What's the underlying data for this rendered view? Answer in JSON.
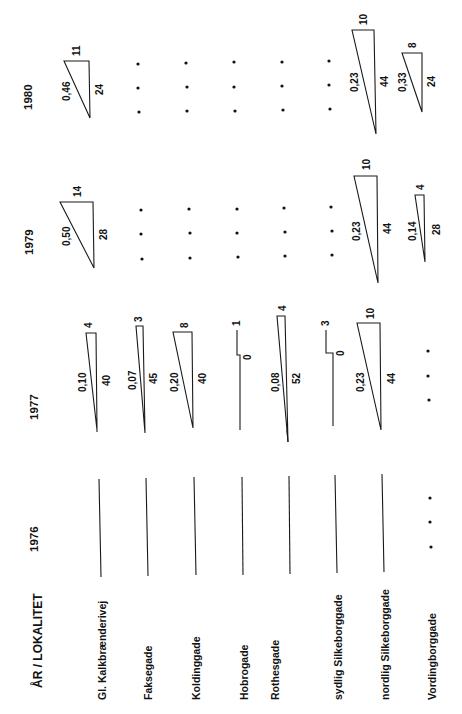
{
  "header": {
    "title": "ÅR / LOKALITET"
  },
  "years": [
    "1976",
    "1977",
    "1979",
    "1980"
  ],
  "localities": [
    "Gl. Kalkbrænderivej",
    "Faksegade",
    "Koldinggade",
    "Hobrogade",
    "Rothesgade",
    "sydlig Silkeborggade",
    "nordlig Silkeborggade",
    "Vordingborggade"
  ],
  "cells": {
    "1976": [
      {
        "type": "line"
      },
      {
        "type": "line"
      },
      {
        "type": "line"
      },
      {
        "type": "line"
      },
      {
        "type": "line"
      },
      {
        "type": "line"
      },
      {
        "type": "line"
      },
      {
        "type": "dots"
      }
    ],
    "1977": [
      {
        "type": "triangle",
        "ratio": "0,10",
        "long": "40",
        "short": "4"
      },
      {
        "type": "triangle",
        "ratio": "0,07",
        "long": "45",
        "short": "3"
      },
      {
        "type": "triangle",
        "ratio": "0,20",
        "long": "40",
        "short": "8"
      },
      {
        "type": "step",
        "long": "0",
        "short": "1"
      },
      {
        "type": "triangle",
        "ratio": "0,08",
        "long": "52",
        "short": "4"
      },
      {
        "type": "step",
        "long": "0",
        "short": "3"
      },
      {
        "type": "triangle",
        "ratio": "0,23",
        "long": "44",
        "short": "10"
      },
      {
        "type": "dots"
      }
    ],
    "1979": [
      {
        "type": "triangle",
        "ratio": "0,50",
        "long": "28",
        "short": "14"
      },
      {
        "type": "dots"
      },
      {
        "type": "dots"
      },
      {
        "type": "dots"
      },
      {
        "type": "dots"
      },
      {
        "type": "dots"
      },
      {
        "type": "triangle",
        "ratio": "0,23",
        "long": "44",
        "short": "10"
      },
      {
        "type": "triangle",
        "ratio": "0,14",
        "long": "28",
        "short": "4"
      }
    ],
    "1980": [
      {
        "type": "triangle",
        "ratio": "0,46",
        "long": "24",
        "short": "11"
      },
      {
        "type": "dots"
      },
      {
        "type": "dots"
      },
      {
        "type": "dots"
      },
      {
        "type": "dots"
      },
      {
        "type": "dots"
      },
      {
        "type": "triangle",
        "ratio": "0,23",
        "long": "44",
        "short": "10"
      },
      {
        "type": "triangle",
        "ratio": "0,33",
        "long": "24",
        "short": "8"
      }
    ]
  }
}
